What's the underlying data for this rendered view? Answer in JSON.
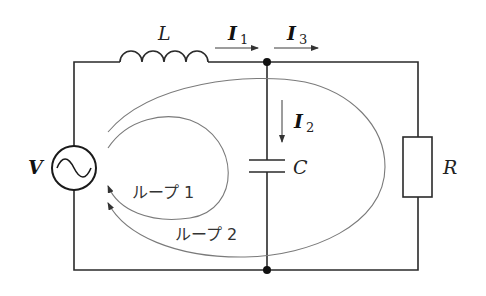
{
  "diagram": {
    "type": "AC circuit with L, C, R and two current loops",
    "components": {
      "source": {
        "label": "V",
        "symbol": "~"
      },
      "inductor": {
        "label": "L"
      },
      "capacitor": {
        "label": "C"
      },
      "resistor": {
        "label": "R"
      }
    },
    "currents": [
      {
        "name": "I",
        "sub": "1",
        "direction": "right"
      },
      {
        "name": "I",
        "sub": "2",
        "direction": "down"
      },
      {
        "name": "I",
        "sub": "3",
        "direction": "right"
      }
    ],
    "loops": [
      {
        "label": "ループ 1"
      },
      {
        "label": "ループ 2"
      }
    ],
    "colors": {
      "wire": "#2a2a2a",
      "loop": "#7a7a7a",
      "background": "#ffffff"
    }
  }
}
